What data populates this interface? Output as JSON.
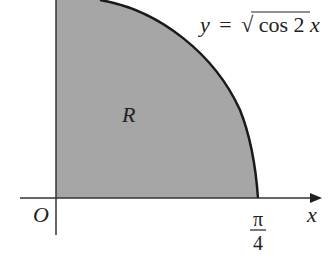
{
  "diagram": {
    "curve_label_lhs": "y",
    "curve_label_eq": "=",
    "curve_label_sqrt": "√",
    "curve_label_rhs": "cos 2",
    "curve_label_var": "x",
    "region_label": "R",
    "origin_label": "O",
    "x_axis_label": "x",
    "x_tick_numerator": "π",
    "x_tick_denominator": "4",
    "colors": {
      "region_fill": "#a6a6a6",
      "curve": "#1a1a1a",
      "axes": "#333333"
    }
  }
}
